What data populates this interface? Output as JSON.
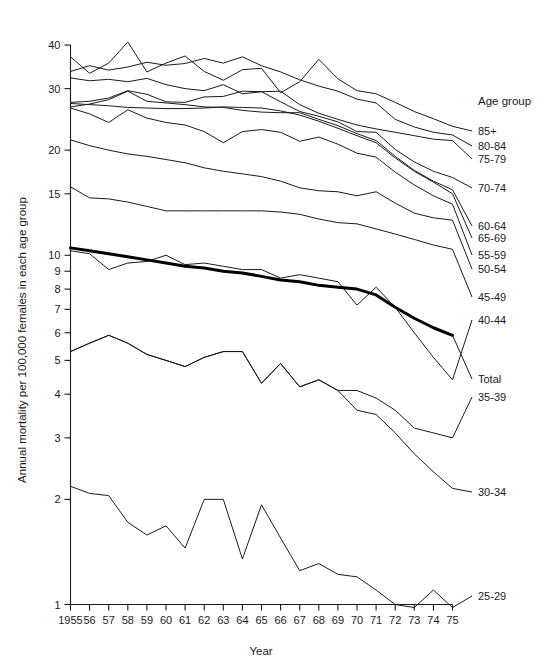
{
  "chart_data": {
    "type": "line",
    "title": "",
    "xlabel": "Year",
    "ylabel": "Annual mortality per 100,000 females in each age group",
    "legend_title": "Age group",
    "legend_position": "right",
    "grid": false,
    "yscale": "log",
    "ylim": [
      1,
      42
    ],
    "ytick_labels": [
      "40",
      "30",
      "20",
      "15",
      "10",
      "9",
      "8",
      "7",
      "6",
      "5",
      "4",
      "3",
      "2",
      "1"
    ],
    "ytick_values": [
      40,
      30,
      20,
      15,
      10,
      9,
      8,
      7,
      6,
      5,
      4,
      3,
      2,
      1
    ],
    "x": [
      1955,
      1956,
      1957,
      1958,
      1959,
      1960,
      1961,
      1962,
      1963,
      1964,
      1965,
      1966,
      1967,
      1968,
      1969,
      1970,
      1971,
      1972,
      1973,
      1974,
      1975
    ],
    "xtick_labels": [
      "1955",
      "56",
      "57",
      "58",
      "59",
      "60",
      "61",
      "62",
      "63",
      "64",
      "65",
      "66",
      "67",
      "68",
      "69",
      "70",
      "71",
      "72",
      "73",
      "74",
      "75"
    ],
    "series": [
      {
        "name": "85+",
        "label": "85+",
        "emphasis": false,
        "values": [
          37.0,
          33.2,
          35.5,
          40.8,
          33.5,
          35.5,
          37.2,
          33.6,
          31.7,
          34.0,
          34.3,
          29.2,
          31.4,
          36.4,
          32.0,
          29.6,
          29.0,
          27.4,
          25.8,
          24.6,
          23.4
        ]
      },
      {
        "name": "80-84",
        "label": "80-84",
        "emphasis": false,
        "values": [
          33.6,
          34.9,
          33.9,
          34.6,
          35.7,
          35.0,
          35.4,
          36.6,
          35.5,
          37.0,
          34.9,
          33.5,
          31.8,
          30.5,
          29.5,
          28.0,
          27.3,
          24.5,
          23.3,
          22.5,
          22.1
        ]
      },
      {
        "name": "75-79",
        "label": "75-79",
        "emphasis": false,
        "values": [
          32.2,
          31.6,
          31.9,
          31.4,
          32.1,
          30.8,
          30.0,
          29.6,
          30.8,
          29.0,
          29.4,
          29.5,
          27.0,
          25.5,
          24.5,
          23.6,
          23.0,
          22.5,
          22.0,
          21.5,
          21.3
        ]
      },
      {
        "name": "70-74",
        "label": "70-74",
        "emphasis": false,
        "values": [
          27.4,
          27.6,
          28.2,
          29.6,
          28.9,
          27.5,
          27.4,
          28.4,
          28.5,
          29.5,
          29.4,
          27.5,
          25.8,
          25.0,
          24.1,
          22.6,
          22.5,
          20.1,
          18.5,
          17.4,
          16.7
        ]
      },
      {
        "name": "60-64",
        "label": "60-64",
        "emphasis": false,
        "values": [
          26.6,
          27.1,
          27.9,
          29.5,
          27.6,
          27.3,
          27.0,
          26.6,
          26.5,
          26.0,
          25.7,
          25.6,
          25.6,
          24.5,
          23.5,
          22.3,
          21.3,
          19.2,
          17.5,
          16.3,
          15.4
        ]
      },
      {
        "name": "65-69",
        "label": "65-69",
        "emphasis": false,
        "values": [
          27.2,
          27.0,
          26.8,
          26.5,
          26.4,
          26.3,
          26.3,
          26.4,
          26.6,
          26.5,
          26.4,
          25.9,
          25.2,
          24.2,
          23.1,
          22.0,
          21.0,
          19.0,
          17.4,
          16.2,
          15.0
        ]
      },
      {
        "name": "55-59",
        "label": "55-59",
        "emphasis": false,
        "values": [
          26.4,
          25.4,
          24.0,
          26.1,
          24.7,
          24.0,
          23.6,
          22.6,
          21.0,
          22.6,
          22.9,
          22.5,
          21.2,
          21.8,
          20.8,
          19.6,
          19.1,
          17.3,
          15.9,
          14.8,
          14.0
        ]
      },
      {
        "name": "50-54",
        "label": "50-54",
        "emphasis": false,
        "values": [
          21.4,
          20.6,
          20.0,
          19.5,
          19.2,
          18.8,
          18.4,
          17.8,
          17.4,
          17.1,
          16.8,
          16.3,
          15.6,
          15.3,
          15.2,
          14.8,
          15.2,
          14.1,
          13.2,
          12.8,
          12.6
        ]
      },
      {
        "name": "45-49",
        "label": "45-49",
        "emphasis": false,
        "values": [
          15.7,
          14.6,
          14.5,
          14.2,
          13.8,
          13.4,
          13.4,
          13.4,
          13.4,
          13.4,
          13.4,
          13.3,
          13.1,
          12.7,
          12.4,
          12.3,
          11.9,
          11.5,
          11.1,
          10.7,
          10.4
        ]
      },
      {
        "name": "40-44",
        "label": "40-44",
        "emphasis": false,
        "values": [
          10.3,
          10.1,
          9.1,
          9.5,
          9.6,
          10.0,
          9.4,
          9.5,
          9.3,
          9.1,
          9.1,
          8.6,
          8.8,
          8.6,
          8.4,
          7.2,
          8.1,
          7.1,
          6.0,
          5.1,
          4.4
        ]
      },
      {
        "name": "Total",
        "label": "Total",
        "emphasis": true,
        "values": [
          10.5,
          10.3,
          10.1,
          9.9,
          9.7,
          9.5,
          9.3,
          9.2,
          9.0,
          8.9,
          8.7,
          8.5,
          8.4,
          8.2,
          8.1,
          8.0,
          7.7,
          7.1,
          6.6,
          6.2,
          5.9
        ]
      },
      {
        "name": "35-39",
        "label": "35-39",
        "emphasis": false,
        "values": [
          5.3,
          5.6,
          5.9,
          5.6,
          5.2,
          5.0,
          4.8,
          5.1,
          5.3,
          5.3,
          4.3,
          4.9,
          4.2,
          4.4,
          4.1,
          4.1,
          3.9,
          3.6,
          3.2,
          3.1,
          3.0
        ]
      },
      {
        "name": "30-34",
        "label": "30-34",
        "emphasis": false,
        "values": [
          5.3,
          5.6,
          5.9,
          5.6,
          5.2,
          5.0,
          4.8,
          5.1,
          5.3,
          5.3,
          4.3,
          4.9,
          4.2,
          4.4,
          4.1,
          3.6,
          3.5,
          3.1,
          2.7,
          2.4,
          2.15
        ]
      },
      {
        "name": "25-29",
        "label": "25-29",
        "emphasis": false,
        "values": [
          2.18,
          2.08,
          2.05,
          1.72,
          1.58,
          1.68,
          1.45,
          2.0,
          2.0,
          1.35,
          1.93,
          1.55,
          1.25,
          1.31,
          1.22,
          1.2,
          1.1,
          1.0,
          0.96,
          1.1,
          0.95
        ]
      }
    ]
  },
  "axis": {
    "x_title": "Year",
    "y_title": "Annual mortality per 100,000 females in each age group"
  },
  "legend": {
    "title": "Age group",
    "entries": [
      {
        "label": "85+"
      },
      {
        "label": "80-84"
      },
      {
        "label": "75-79"
      },
      {
        "label": "70-74"
      },
      {
        "label": "60-64"
      },
      {
        "label": "65-69"
      },
      {
        "label": "55-59"
      },
      {
        "label": "50-54"
      },
      {
        "label": "45-49"
      },
      {
        "label": "40-44"
      },
      {
        "label": "Total"
      },
      {
        "label": "35-39"
      },
      {
        "label": "30-34"
      },
      {
        "label": "25-29"
      }
    ]
  },
  "colors": {
    "line": "#1a1a1a",
    "emphasis_line": "#000000",
    "background": "#ffffff"
  }
}
